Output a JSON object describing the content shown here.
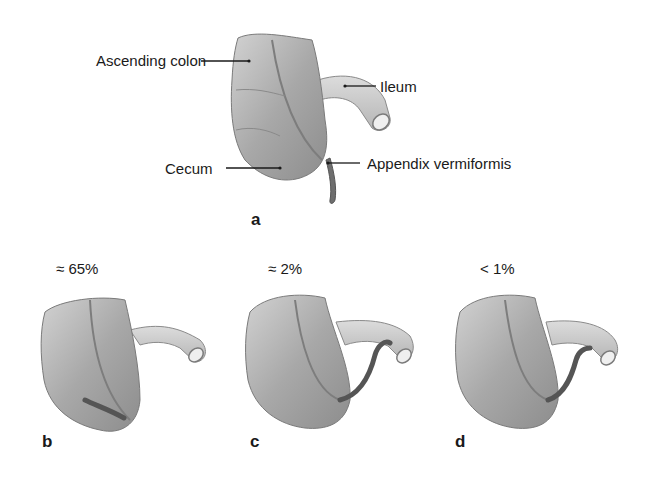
{
  "figure": {
    "panel_a": {
      "letter": "a",
      "labels": {
        "ascending_colon": "Ascending colon",
        "ileum": "Ileum",
        "cecum": "Cecum",
        "appendix": "Appendix vermiformis"
      }
    },
    "panel_b": {
      "letter": "b",
      "frequency": "≈ 65%"
    },
    "panel_c": {
      "letter": "c",
      "frequency": "≈ 2%"
    },
    "panel_d": {
      "letter": "d",
      "frequency": "< 1%"
    }
  },
  "colors": {
    "background": "#ffffff",
    "colon_fill": "#a9a9a9",
    "colon_shade": "#8a8a8a",
    "ileum_fill": "#cfcfcf",
    "appendix_fill": "#5a5a5a",
    "leader_line": "#1a1a1a"
  }
}
